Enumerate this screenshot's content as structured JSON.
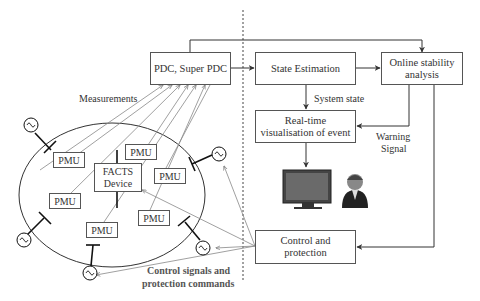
{
  "boxes": {
    "pdc": "PDC, Super PDC",
    "state_estimation": "State Estimation",
    "online_stability_1": "Online stability",
    "online_stability_2": "analysis",
    "realtime_1": "Real-time",
    "realtime_2": "visualisation of event",
    "control_1": "Control and",
    "control_2": "protection",
    "facts_1": "FACTS",
    "facts_2": "Device"
  },
  "pmu_label": "PMU",
  "labels": {
    "measurements": "Measurements",
    "system_state": "System state",
    "warning_1": "Warning",
    "warning_2": "Signal",
    "control_signals_1": "Control signals and",
    "control_signals_2": "protection commands"
  },
  "pmus": [
    {
      "x": 53,
      "y": 152
    },
    {
      "x": 133,
      "y": 151
    },
    {
      "x": 154,
      "y": 168
    },
    {
      "x": 49,
      "y": 198
    },
    {
      "x": 138,
      "y": 210
    },
    {
      "x": 86,
      "y": 222
    }
  ],
  "icons": [
    "generator-icon",
    "monitor-icon",
    "operator-icon"
  ]
}
